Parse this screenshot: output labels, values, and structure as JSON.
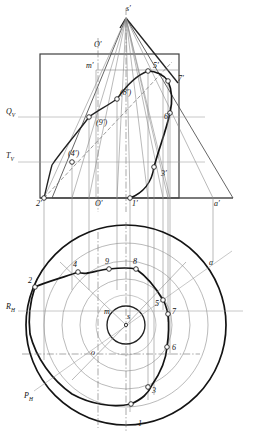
{
  "figure": {
    "type": "descriptive-geometry-projection",
    "colors": {
      "outline": "#3a3a3a",
      "thick_curve": "#111111",
      "thin_construction": "#8c8c8c",
      "axis_line": "#9a9a9a",
      "marker_fill": "#ffffff",
      "marker_stroke": "#222222",
      "background": "#ffffff"
    }
  },
  "front_view": {
    "trace_labels": [
      {
        "key": "Qv",
        "text": "Q",
        "sub": "V",
        "x": 6,
        "y": 108
      },
      {
        "key": "Tv",
        "text": "T",
        "sub": "V",
        "x": 6,
        "y": 152
      }
    ],
    "point_labels": [
      {
        "key": "apex",
        "text": "s′",
        "x": 126,
        "y": 5
      },
      {
        "key": "o-top",
        "text": "O′",
        "x": 94,
        "y": 41
      },
      {
        "key": "m",
        "text": "m′",
        "x": 86,
        "y": 62
      },
      {
        "key": "p5",
        "text": "5′",
        "x": 153,
        "y": 62
      },
      {
        "key": "p7",
        "text": "7′",
        "x": 178,
        "y": 75
      },
      {
        "key": "p8",
        "text": "(8′)",
        "x": 120,
        "y": 89
      },
      {
        "key": "p6",
        "text": "6′",
        "x": 164,
        "y": 113
      },
      {
        "key": "p9",
        "text": "(9′)",
        "x": 96,
        "y": 119
      },
      {
        "key": "p4",
        "text": "(4′)",
        "x": 68,
        "y": 150
      },
      {
        "key": "p3",
        "text": "3′",
        "x": 161,
        "y": 170
      },
      {
        "key": "p2",
        "text": "2′",
        "x": 36,
        "y": 207
      },
      {
        "key": "o-bottom",
        "text": "O′",
        "x": 95,
        "y": 207
      },
      {
        "key": "p1",
        "text": "1′",
        "x": 139,
        "y": 207
      },
      {
        "key": "a",
        "text": "a′",
        "x": 214,
        "y": 207
      }
    ]
  },
  "plan_view": {
    "trace_labels": [
      {
        "key": "Rh",
        "text": "R",
        "sub": "H",
        "x": 6,
        "y": 303
      },
      {
        "key": "Ph",
        "text": "P",
        "sub": "H",
        "x": 24,
        "y": 396
      }
    ],
    "point_labels": [
      {
        "key": "p2",
        "text": "2",
        "x": 29,
        "y": 281
      },
      {
        "key": "p4",
        "text": "4",
        "x": 74,
        "y": 264
      },
      {
        "key": "p9",
        "text": "9",
        "x": 105,
        "y": 261
      },
      {
        "key": "p8",
        "text": "8",
        "x": 133,
        "y": 261
      },
      {
        "key": "a",
        "text": "a",
        "x": 209,
        "y": 265
      },
      {
        "key": "m",
        "text": "m",
        "x": 106,
        "y": 312
      },
      {
        "key": "s",
        "text": "s",
        "x": 127,
        "y": 316
      },
      {
        "key": "p5",
        "text": "5",
        "x": 155,
        "y": 307
      },
      {
        "key": "p7",
        "text": "7",
        "x": 172,
        "y": 313
      },
      {
        "key": "p6",
        "text": "6",
        "x": 172,
        "y": 348
      },
      {
        "key": "o",
        "text": "o",
        "x": 92,
        "y": 352
      },
      {
        "key": "p3",
        "text": "3",
        "x": 153,
        "y": 391
      },
      {
        "key": "p1",
        "text": "1",
        "x": 139,
        "y": 424
      }
    ]
  },
  "markers": {
    "front": [
      {
        "name": "marker-2p",
        "x": 44,
        "y": 198
      },
      {
        "name": "marker-4p",
        "x": 72,
        "y": 162
      },
      {
        "name": "marker-9p",
        "x": 89,
        "y": 117
      },
      {
        "name": "marker-8p",
        "x": 117,
        "y": 99
      },
      {
        "name": "marker-5p",
        "x": 148,
        "y": 71
      },
      {
        "name": "marker-7p",
        "x": 168,
        "y": 81
      },
      {
        "name": "marker-6p",
        "x": 170,
        "y": 113
      },
      {
        "name": "marker-3p",
        "x": 154,
        "y": 167
      },
      {
        "name": "marker-1p",
        "x": 130,
        "y": 198
      }
    ],
    "plan": [
      {
        "name": "marker-2",
        "x": 35,
        "y": 287
      },
      {
        "name": "marker-4",
        "x": 78,
        "y": 272
      },
      {
        "name": "marker-9",
        "x": 109,
        "y": 269
      },
      {
        "name": "marker-8",
        "x": 136,
        "y": 269
      },
      {
        "name": "marker-5",
        "x": 163,
        "y": 300
      },
      {
        "name": "marker-7",
        "x": 168,
        "y": 314
      },
      {
        "name": "marker-6",
        "x": 167,
        "y": 347
      },
      {
        "name": "marker-3",
        "x": 148,
        "y": 387
      },
      {
        "name": "marker-1",
        "x": 131,
        "y": 404
      }
    ]
  }
}
